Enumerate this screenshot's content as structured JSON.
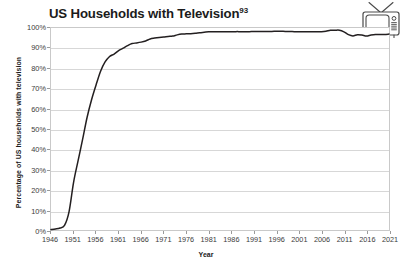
{
  "title": {
    "text": "US Households with Television",
    "superscript": "93"
  },
  "icon": {
    "name": "retro-television-icon",
    "label": "Retro television set with antenna"
  },
  "colors": {
    "line": "#231f20",
    "gridline": "#d7d7d7",
    "frame": "#c9c9c9",
    "text": "#231f20",
    "background": "#ffffff"
  },
  "chart_data": {
    "type": "line",
    "title": "US Households with Television",
    "xlabel": "Year",
    "ylabel": "Percentage of US households with television",
    "xlim": [
      1946,
      2021
    ],
    "ylim": [
      0,
      100
    ],
    "grid": true,
    "legend": false,
    "y_tick_labels": [
      "100%",
      "90%",
      "80%",
      "70%",
      "60%",
      "50%",
      "40%",
      "30%",
      "20%",
      "10%",
      "0%"
    ],
    "y_tick_values": [
      100,
      90,
      80,
      70,
      60,
      50,
      40,
      30,
      20,
      10,
      0
    ],
    "x_tick_labels": [
      "1946",
      "1951",
      "1956",
      "1961",
      "1966",
      "1971",
      "1976",
      "1981",
      "1986",
      "1991",
      "1996",
      "2001",
      "2006",
      "2011",
      "2016",
      "2021"
    ],
    "x_tick_values": [
      1946,
      1951,
      1956,
      1961,
      1966,
      1971,
      1976,
      1981,
      1986,
      1991,
      1996,
      2001,
      2006,
      2011,
      2016,
      2021
    ],
    "series": [
      {
        "name": "US households with television",
        "x": [
          1946,
          1947,
          1948,
          1949,
          1950,
          1951,
          1952,
          1953,
          1954,
          1955,
          1956,
          1957,
          1958,
          1959,
          1960,
          1961,
          1962,
          1963,
          1964,
          1965,
          1966,
          1967,
          1968,
          1969,
          1970,
          1971,
          1972,
          1973,
          1974,
          1975,
          1976,
          1977,
          1978,
          1979,
          1980,
          1981,
          1982,
          1983,
          1984,
          1985,
          1986,
          1987,
          1988,
          1989,
          1990,
          1991,
          1992,
          1993,
          1994,
          1995,
          1996,
          1997,
          1998,
          1999,
          2000,
          2001,
          2002,
          2003,
          2004,
          2005,
          2006,
          2007,
          2008,
          2009,
          2010,
          2011,
          2012,
          2013,
          2014,
          2015,
          2016,
          2017,
          2018,
          2019,
          2020,
          2021
        ],
        "y": [
          0.2,
          0.5,
          1.0,
          2.3,
          9.0,
          23.5,
          34.2,
          44.7,
          55.7,
          64.5,
          71.8,
          78.6,
          83.2,
          85.9,
          87.1,
          88.8,
          90.0,
          91.3,
          92.3,
          92.6,
          93.0,
          93.6,
          94.6,
          95.0,
          95.3,
          95.5,
          95.8,
          96.0,
          96.6,
          97.0,
          97.1,
          97.2,
          97.4,
          97.7,
          97.9,
          98.1,
          98.1,
          98.1,
          98.1,
          98.1,
          98.1,
          98.2,
          98.2,
          98.2,
          98.2,
          98.3,
          98.3,
          98.3,
          98.3,
          98.3,
          98.4,
          98.4,
          98.3,
          98.3,
          98.2,
          98.2,
          98.2,
          98.2,
          98.2,
          98.2,
          98.2,
          98.4,
          98.9,
          98.9,
          98.9,
          98.1,
          96.7,
          96.1,
          96.7,
          96.5,
          96.0,
          96.5,
          96.8,
          96.8,
          96.8,
          97.0
        ]
      }
    ]
  }
}
